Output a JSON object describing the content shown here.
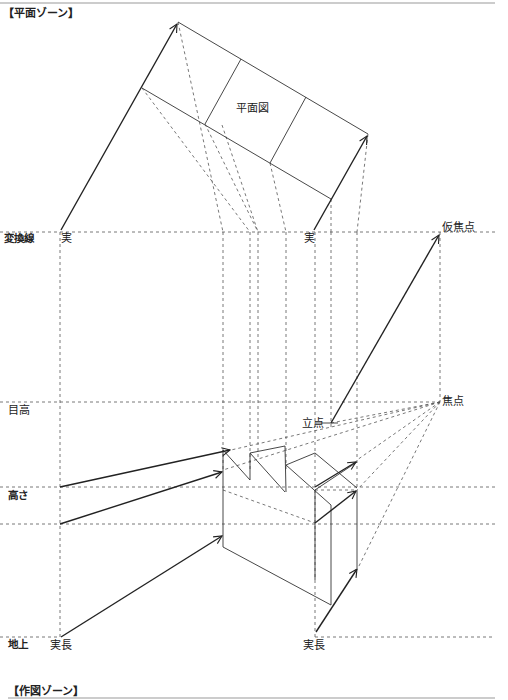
{
  "zones": {
    "top": "【平面ゾーン】",
    "bottom": "【作図ゾーン】"
  },
  "plan": {
    "label": "平面図"
  },
  "left_labels": {
    "transform_line": "変換線",
    "eye_level": "目高",
    "height": "高さ",
    "ground": "地上"
  },
  "point_labels": {
    "real_left": "実",
    "real_right": "実",
    "temp_focus": "仮焦点",
    "focus": "焦点",
    "standpoint": "立点",
    "true_length_left": "実長",
    "true_length_right": "実長"
  },
  "colors": {
    "line": "#222222",
    "dash": "#555555",
    "rule": "#999999"
  }
}
